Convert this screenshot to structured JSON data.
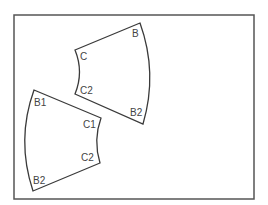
{
  "diagram": {
    "frame": {
      "x": 14,
      "y": 15,
      "width": 240,
      "height": 184
    },
    "pieces": [
      {
        "name": "upper-piece",
        "labels": [
          {
            "text": "B",
            "x": 132,
            "y": 37
          },
          {
            "text": "C",
            "x": 80,
            "y": 60
          },
          {
            "text": "C2",
            "x": 80,
            "y": 94
          },
          {
            "text": "B2",
            "x": 130,
            "y": 116
          }
        ]
      },
      {
        "name": "lower-piece",
        "labels": [
          {
            "text": "B1",
            "x": 34,
            "y": 106
          },
          {
            "text": "C1",
            "x": 83,
            "y": 128
          },
          {
            "text": "C2",
            "x": 81,
            "y": 161
          },
          {
            "text": "B2",
            "x": 33,
            "y": 184
          }
        ]
      }
    ]
  }
}
